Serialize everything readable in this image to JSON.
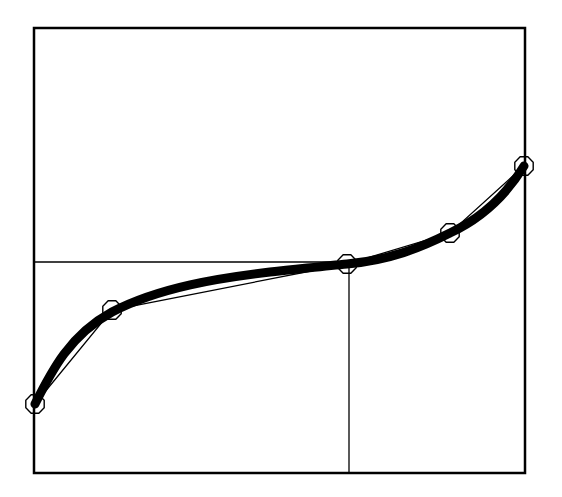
{
  "diagram": {
    "type": "curve-through-control-points",
    "frame": {
      "x1": 34,
      "y1": 28,
      "x2": 525,
      "y2": 473,
      "stroke": "#000000",
      "stroke_width": 2.5
    },
    "control_points": [
      {
        "x": 35,
        "y": 404
      },
      {
        "x": 112,
        "y": 310
      },
      {
        "x": 347,
        "y": 264
      },
      {
        "x": 450,
        "y": 233
      },
      {
        "x": 524,
        "y": 166
      }
    ],
    "control_polyline": {
      "stroke": "#000000",
      "stroke_width": 1.3
    },
    "curve": {
      "path": "M35,404 C52,370 70,335 112,312 C160,287 220,278 270,272 C300,269 325,266 347,264 C390,260 420,248 450,233 C480,219 505,197 524,166",
      "stroke": "#000000",
      "stroke_width": 9
    },
    "marker": {
      "shape": "octagon",
      "radius": 10,
      "stroke": "#000000",
      "stroke_width": 1.4,
      "fill": "none"
    },
    "guide_lines": {
      "horizontal": {
        "x1": 34,
        "y1": 262,
        "x2": 347,
        "y2": 262
      },
      "vertical": {
        "x1": 349,
        "y1": 264,
        "x2": 349,
        "y2": 473
      },
      "stroke": "#000000",
      "stroke_width": 1.3
    }
  }
}
